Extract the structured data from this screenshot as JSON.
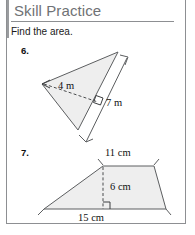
{
  "header": {
    "title": "Skill Practice"
  },
  "instruction": "Find the area.",
  "problems": [
    {
      "number": "6.",
      "figure": "triangle",
      "labels": {
        "height": "4 m",
        "base": "7 m"
      },
      "marks": [
        "right-angle-marker",
        "dimension-line-arrows",
        "height-arrow"
      ]
    },
    {
      "number": "7.",
      "figure": "trapezoid",
      "labels": {
        "top": "11 cm",
        "height": "6 cm",
        "bottom": "15 cm"
      },
      "marks": [
        "right-angle-marker",
        "top-tick-marks",
        "bottom-tick-marks"
      ]
    }
  ],
  "colors": {
    "heading_text": "#6f7275",
    "body_text": "#1a1a1a",
    "rule": "#8d8f92",
    "shape_fill": "#eeeeee",
    "shape_stroke": "#5c5e60"
  }
}
